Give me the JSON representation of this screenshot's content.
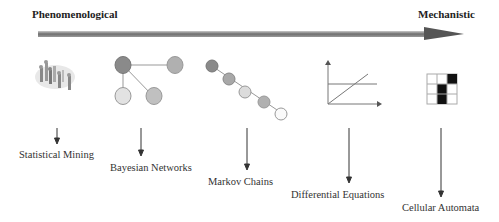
{
  "axis": {
    "left_label": "Phenomenological",
    "right_label": "Mechanistic"
  },
  "methods": [
    {
      "label": "Statistical Mining",
      "icon": "scatter-cloud-icon"
    },
    {
      "label": "Bayesian Networks",
      "icon": "network-graph-icon"
    },
    {
      "label": "Markov Chains",
      "icon": "chain-nodes-icon"
    },
    {
      "label": "Differential Equations",
      "icon": "line-graph-icon"
    },
    {
      "label": "Cellular Automata",
      "icon": "grid-cells-icon"
    }
  ],
  "colors": {
    "arrow_dark": "#555555",
    "arrow_light": "#aaaaaa",
    "node_dark": "#8a8a8a",
    "node_mid": "#b5b5b5",
    "node_light": "#e2e2e2",
    "cell_filled": "#111111"
  }
}
